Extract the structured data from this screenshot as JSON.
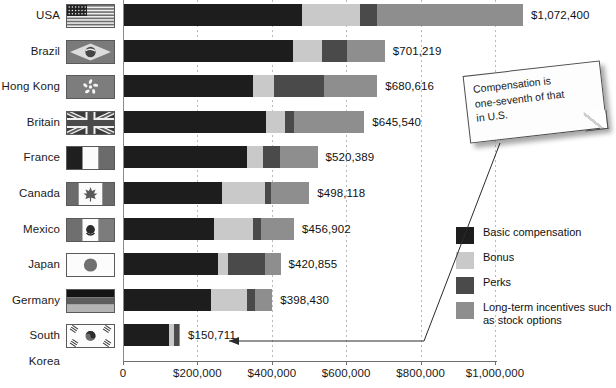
{
  "chart_data": {
    "type": "bar",
    "orientation": "horizontal",
    "stacked": true,
    "title": "",
    "xlabel": "",
    "ylabel": "",
    "xlim": [
      0,
      1000000
    ],
    "grid": true,
    "legend_position": "right",
    "categories": [
      "USA",
      "Brazil",
      "Hong Kong",
      "Britain",
      "France",
      "Canada",
      "Mexico",
      "Japan",
      "Germany",
      "South Korea"
    ],
    "series": [
      {
        "name": "Basic compensation",
        "color": "#1d1d1d",
        "values": [
          478000,
          455000,
          347000,
          383000,
          330000,
          263000,
          241000,
          253000,
          233000,
          122000
        ]
      },
      {
        "name": "Bonus",
        "color": "#c9c9c9",
        "values": [
          156000,
          78000,
          56000,
          50000,
          43000,
          116000,
          105000,
          26000,
          97000,
          12000
        ]
      },
      {
        "name": "Perks",
        "color": "#4a4a4a",
        "values": [
          46000,
          67000,
          134000,
          24000,
          47000,
          17000,
          23000,
          100000,
          22000,
          14000
        ]
      },
      {
        "name": "Long-term incentives such as stock options",
        "color": "#8e8e8e",
        "values": [
          392400,
          101219,
          143616,
          188540,
          100389,
          102118,
          87902,
          41855,
          46430,
          2711
        ]
      }
    ],
    "totals": [
      "$1,072,400",
      "$701,219",
      "$680,616",
      "$645,540",
      "$520,389",
      "$498,118",
      "$456,902",
      "$420,855",
      "$398,430",
      "$150,711"
    ],
    "tick_values": [
      0,
      200000,
      400000,
      600000,
      800000,
      1000000
    ],
    "tick_labels": [
      "0",
      "$200,000",
      "$400,000",
      "$600,000",
      "$800,000",
      "$1,000,000"
    ],
    "annotation": "Compensation is one-seventh of that in U.S.",
    "annotation_target": "South Korea"
  },
  "rows": [
    {
      "country": "USA",
      "flag": "usa-flag",
      "total": "$1,072,400"
    },
    {
      "country": "Brazil",
      "flag": "brazil-flag",
      "total": "$701,219"
    },
    {
      "country": "Hong Kong",
      "flag": "hong-kong-flag",
      "total": "$680,616"
    },
    {
      "country": "Britain",
      "flag": "britain-flag",
      "total": "$645,540"
    },
    {
      "country": "France",
      "flag": "france-flag",
      "total": "$520,389"
    },
    {
      "country": "Canada",
      "flag": "canada-flag",
      "total": "$498,118"
    },
    {
      "country": "Mexico",
      "flag": "mexico-flag",
      "total": "$456,902"
    },
    {
      "country": "Japan",
      "flag": "japan-flag",
      "total": "$420,855"
    },
    {
      "country": "Germany",
      "flag": "germany-flag",
      "total": "$398,430"
    },
    {
      "country": "South Korea",
      "flag": "south-korea-flag",
      "total": "$150,711"
    }
  ],
  "legend": {
    "items": [
      {
        "label": "Basic compensation",
        "color": "#1d1d1d",
        "key": "basic"
      },
      {
        "label": "Bonus",
        "color": "#c9c9c9",
        "key": "bonus"
      },
      {
        "label": "Perks",
        "color": "#4a4a4a",
        "key": "perks"
      },
      {
        "label": "Long-term incentives such as stock options",
        "color": "#8e8e8e",
        "key": "lti"
      }
    ]
  },
  "callout": {
    "line1": "Compensation is",
    "line2": "one-seventh of that",
    "line3": "in U.S."
  },
  "axis": {
    "labels": [
      "0",
      "$200,000",
      "$400,000",
      "$600,000",
      "$800,000",
      "$1,000,000"
    ]
  }
}
